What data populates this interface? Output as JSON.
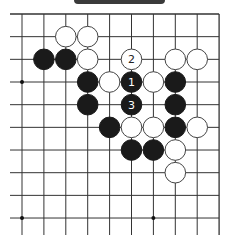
{
  "header": {
    "tab_color": "#3a3a3a"
  },
  "board": {
    "columns": 10,
    "rows": 10,
    "origin_x": 22,
    "origin_y": 14,
    "spacing_x": 21.9,
    "spacing_y": 22.67,
    "line_color": "#333333",
    "edges": {
      "top": true,
      "right": true,
      "left": false,
      "bottom": false
    },
    "star_points": [
      [
        0,
        3
      ],
      [
        0,
        9
      ],
      [
        6,
        9
      ]
    ],
    "stones": [
      {
        "col": 2,
        "row": 1,
        "color": "white"
      },
      {
        "col": 3,
        "row": 1,
        "color": "white"
      },
      {
        "col": 1,
        "row": 2,
        "color": "black"
      },
      {
        "col": 2,
        "row": 2,
        "color": "black"
      },
      {
        "col": 3,
        "row": 2,
        "color": "white"
      },
      {
        "col": 5,
        "row": 2,
        "color": "white",
        "label": "2"
      },
      {
        "col": 7,
        "row": 2,
        "color": "white"
      },
      {
        "col": 8,
        "row": 2,
        "color": "white"
      },
      {
        "col": 3,
        "row": 3,
        "color": "black"
      },
      {
        "col": 4,
        "row": 3,
        "color": "white"
      },
      {
        "col": 5,
        "row": 3,
        "color": "black",
        "label": "1"
      },
      {
        "col": 6,
        "row": 3,
        "color": "white"
      },
      {
        "col": 7,
        "row": 3,
        "color": "black"
      },
      {
        "col": 3,
        "row": 4,
        "color": "black"
      },
      {
        "col": 5,
        "row": 4,
        "color": "black",
        "label": "3"
      },
      {
        "col": 7,
        "row": 4,
        "color": "black"
      },
      {
        "col": 4,
        "row": 5,
        "color": "black"
      },
      {
        "col": 5,
        "row": 5,
        "color": "white"
      },
      {
        "col": 6,
        "row": 5,
        "color": "white"
      },
      {
        "col": 7,
        "row": 5,
        "color": "black"
      },
      {
        "col": 8,
        "row": 5,
        "color": "white"
      },
      {
        "col": 5,
        "row": 6,
        "color": "black"
      },
      {
        "col": 6,
        "row": 6,
        "color": "black"
      },
      {
        "col": 7,
        "row": 6,
        "color": "white"
      },
      {
        "col": 7,
        "row": 7,
        "color": "white"
      }
    ]
  }
}
